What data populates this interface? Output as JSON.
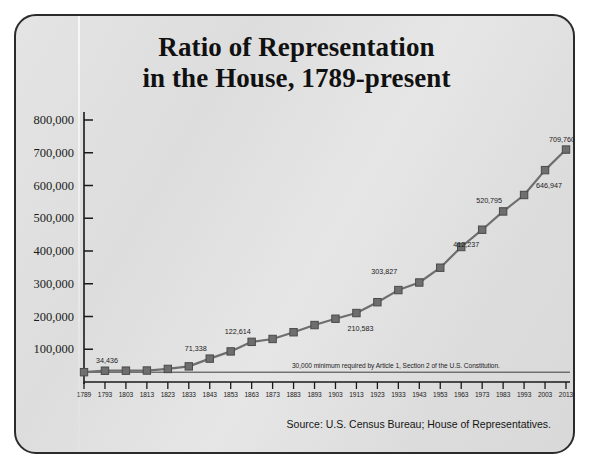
{
  "title": {
    "line1": "Ratio of Representation",
    "line2": "in the House, 1789-present"
  },
  "source": "Source: U.S. Census Bureau; House of Representatives.",
  "annotation": "30,000 minimum required by Article 1, Section 2 of the U.S. Constitution.",
  "colors": {
    "card_border": "#2b2b2b",
    "card_background": "#e0e0e0",
    "line": "#6e6e6e",
    "marker": "#6e6e6e",
    "marker_edge": "#4a4a4a",
    "axis": "#1a1a1a",
    "text": "#141414"
  },
  "chart_data": {
    "type": "line",
    "title": "Ratio of Representation in the House, 1789-present",
    "xlabel": "",
    "ylabel": "",
    "ylim": [
      0,
      800000
    ],
    "yticks": [
      100000,
      200000,
      300000,
      400000,
      500000,
      600000,
      700000,
      800000
    ],
    "ytick_labels": [
      "100,000",
      "200,000",
      "300,000",
      "400,000",
      "500,000",
      "600,000",
      "700,000",
      "800,000"
    ],
    "grid": false,
    "legend": null,
    "categories": [
      "1789",
      "1793",
      "1803",
      "1813",
      "1823",
      "1833",
      "1843",
      "1853",
      "1863",
      "1873",
      "1883",
      "1893",
      "1903",
      "1913",
      "1923",
      "1933",
      "1943",
      "1953",
      "1963",
      "1973",
      "1983",
      "1993",
      "2003",
      "2013"
    ],
    "values": [
      30000,
      34436,
      34609,
      35000,
      39900,
      47700,
      71338,
      93400,
      122614,
      131400,
      151900,
      173900,
      193167,
      210583,
      243700,
      280675,
      303827,
      349000,
      412237,
      465000,
      520795,
      571000,
      646947,
      709760
    ],
    "point_labels": [
      {
        "x": "1793",
        "value": 34436,
        "text": "34,436"
      },
      {
        "x": "1843",
        "value": 71338,
        "text": "71,338"
      },
      {
        "x": "1863",
        "value": 122614,
        "text": "122,614"
      },
      {
        "x": "1913",
        "value": 210583,
        "text": "210,583"
      },
      {
        "x": "1933",
        "value": 303827,
        "text": "303,827"
      },
      {
        "x": "1953",
        "value": 412237,
        "text": "412,237"
      },
      {
        "x": "1983",
        "value": 520795,
        "text": "520,795"
      },
      {
        "x": "2003",
        "value": 646947,
        "text": "646,947"
      },
      {
        "x": "2013",
        "value": 709760,
        "text": "709,760"
      }
    ],
    "reference_line": {
      "value": 30000,
      "label": "30,000 minimum required by Article 1, Section 2 of the U.S. Constitution."
    }
  }
}
